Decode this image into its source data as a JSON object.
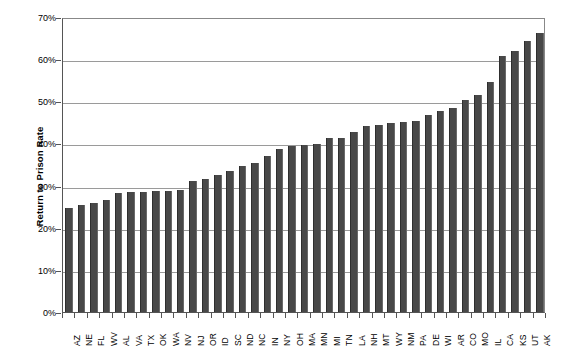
{
  "chart_data": {
    "type": "bar",
    "title": "",
    "xlabel": "",
    "ylabel": "Return to Prison Rate",
    "ylim": [
      0,
      70
    ],
    "ytick_labels": [
      "0%",
      "10%",
      "20%",
      "30%",
      "40%",
      "50%",
      "60%",
      "70%"
    ],
    "ytick_values": [
      0,
      10,
      20,
      30,
      40,
      50,
      60,
      70
    ],
    "grid": true,
    "legend": false,
    "bar_color": "#484848",
    "categories": [
      "AZ",
      "NE",
      "FL",
      "WV",
      "AL",
      "VA",
      "TX",
      "OK",
      "WA",
      "NV",
      "NJ",
      "OR",
      "ID",
      "SC",
      "ND",
      "NC",
      "IN",
      "NY",
      "OH",
      "MA",
      "MN",
      "MI",
      "TN",
      "LA",
      "NH",
      "MT",
      "WY",
      "NM",
      "PA",
      "DE",
      "WI",
      "AR",
      "CO",
      "MO",
      "IL",
      "CA",
      "KS",
      "UT",
      "AK"
    ],
    "values": [
      24.7,
      25.4,
      25.9,
      26.5,
      28.2,
      28.4,
      28.5,
      28.6,
      28.7,
      28.9,
      31.1,
      31.6,
      32.5,
      33.5,
      34.7,
      35.4,
      37.0,
      38.6,
      39.4,
      39.7,
      39.9,
      41.2,
      41.4,
      42.6,
      44.1,
      44.4,
      44.9,
      45.2,
      45.4,
      46.7,
      47.7,
      48.5,
      50.4,
      51.4,
      54.5,
      60.7,
      62.0,
      64.3,
      66.1
    ]
  }
}
